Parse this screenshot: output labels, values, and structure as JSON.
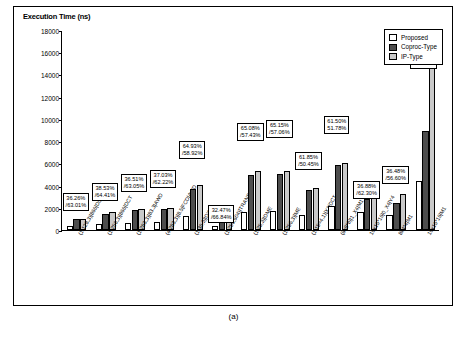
{
  "chart_data": {
    "type": "bar",
    "title": "Execution Time (ns)",
    "xlabel": "",
    "ylabel": "Execution Time (ns)",
    "ylim": [
      0,
      18000
    ],
    "yticks": [
      0,
      2000,
      4000,
      6000,
      8000,
      10000,
      12000,
      14000,
      16000,
      18000
    ],
    "grid": false,
    "legend_position": "top-right",
    "categories": [
      "(1,128,3)|866|DCT",
      "(1,256,3)|866|DCT",
      "(1,283,3)|83.3|AWD",
      "(4,283,3)|8.5|FCD|AWD",
      "(1,36,3)|DWD",
      "(1,256,604)|TRANS",
      "(1,25,3)|DME",
      "(1,256,3)|ME",
      "(1,15=4,1)|X1|DCT",
      "(8x8*8)|1_X4|M1",
      "16x16*16|0_X4|Y4",
      "8x4*4|M1",
      "16x16*16|M1"
    ],
    "series": [
      {
        "name": "Proposed",
        "values": [
          360,
          560,
          640,
          700,
          1250,
          320,
          1650,
          1720,
          1330,
          2180,
          1580,
          1380,
          4450
        ]
      },
      {
        "name": "Coproc-Type",
        "values": [
          960,
          1480,
          1800,
          1920,
          3720,
          960,
          4950,
          5000,
          3600,
          5830,
          2820,
          2450,
          8900
        ]
      },
      {
        "name": "IP-Type",
        "values": [
          1000,
          1580,
          1850,
          2000,
          4020,
          1000,
          5340,
          5320,
          3780,
          6020,
          3050,
          3280,
          17200
        ]
      }
    ],
    "annotations": [
      {
        "index": 0,
        "text": "36.26%\n/63.01%"
      },
      {
        "index": 1,
        "text": "38.53%\n/64.41%"
      },
      {
        "index": 2,
        "text": "36.51%\n/63.05%"
      },
      {
        "index": 3,
        "text": "37.03%\n/62.22%"
      },
      {
        "index": 4,
        "text": "64.93%\n/58.92%"
      },
      {
        "index": 5,
        "text": "32.47%\n/66.84%"
      },
      {
        "index": 6,
        "text": "65.08%\n/57.43%"
      },
      {
        "index": 7,
        "text": "65.15%\n/57.06%"
      },
      {
        "index": 8,
        "text": "61.85%\n/50.45%"
      },
      {
        "index": 9,
        "text": "61.50%\n51.78%"
      },
      {
        "index": 10,
        "text": "36.88%\n/62.30%"
      },
      {
        "index": 11,
        "text": "36.48%\n/56.60%"
      },
      {
        "index": 12,
        "text": "72.92%\n/49.46%"
      }
    ]
  },
  "legend": {
    "items": [
      {
        "label": "Proposed",
        "color": "#ffffff"
      },
      {
        "label": "Coproc-Type",
        "color": "#4d4d4d"
      },
      {
        "label": "IP-Type",
        "color": "#c9c9c9"
      }
    ]
  },
  "caption": "(a)"
}
